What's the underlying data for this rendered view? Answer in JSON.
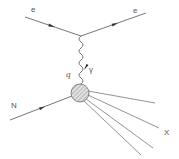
{
  "diagram": {
    "type": "feynman-diagram",
    "colors": {
      "line": "#666666",
      "blob_fill": "#d8d8d8",
      "hatch": "#888888",
      "text": "#555555"
    },
    "labels": {
      "electron_in": "e",
      "electron_out": "e",
      "momentum_transfer": "q",
      "photon": "γ",
      "nucleon": "N",
      "final_state": "X"
    },
    "nodes": [
      {
        "id": "electron-vertex",
        "x": 81,
        "y": 36
      },
      {
        "id": "hadron-blob",
        "x": 80,
        "y": 93,
        "r": 9
      }
    ],
    "edges": [
      {
        "id": "electron-in",
        "from": [
          25,
          17
        ],
        "to": [
          81,
          36
        ],
        "style": "fermion",
        "label": "e"
      },
      {
        "id": "electron-out",
        "from": [
          81,
          36
        ],
        "to": [
          146,
          13
        ],
        "style": "fermion",
        "label": "e"
      },
      {
        "id": "virtual-photon",
        "from": [
          81,
          36
        ],
        "to": [
          80,
          84
        ],
        "style": "wavy",
        "label": "γ",
        "momentum": "q"
      },
      {
        "id": "nucleon-in",
        "from": [
          10,
          120
        ],
        "to": [
          72,
          96
        ],
        "style": "fermion",
        "label": "N"
      },
      {
        "id": "hadron-1",
        "from": [
          88,
          91
        ],
        "to": [
          155,
          103
        ],
        "style": "plain"
      },
      {
        "id": "hadron-2",
        "from": [
          88,
          95
        ],
        "to": [
          159,
          128
        ],
        "style": "plain"
      },
      {
        "id": "hadron-3",
        "from": [
          86,
          99
        ],
        "to": [
          153,
          148
        ],
        "style": "plain"
      },
      {
        "id": "hadron-4",
        "from": [
          84,
          101
        ],
        "to": [
          141,
          155
        ],
        "style": "plain"
      }
    ]
  }
}
